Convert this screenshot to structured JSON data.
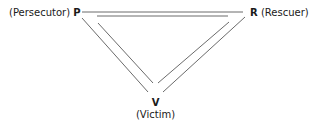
{
  "diagram": {
    "nodes": {
      "persecutor": {
        "letter": "P",
        "role": "(Persecutor)"
      },
      "rescuer": {
        "letter": "R",
        "role": "(Rescuer)"
      },
      "victim": {
        "letter": "V",
        "role": "(Victim)"
      }
    },
    "edges": [
      {
        "from": "P",
        "to": "R",
        "style": "double-line"
      },
      {
        "from": "P",
        "to": "V",
        "style": "double-line"
      },
      {
        "from": "R",
        "to": "V",
        "style": "double-line"
      }
    ],
    "colors": {
      "line": "#6b6b6b",
      "text": "#1a1a1a",
      "background": "#ffffff"
    }
  }
}
